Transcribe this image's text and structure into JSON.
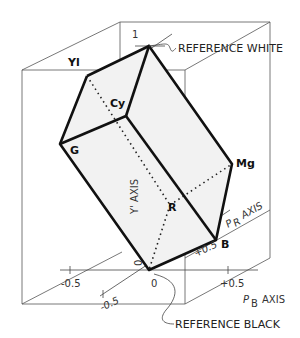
{
  "diagram": {
    "type": "color-space-solid",
    "vertices": {
      "yellow": "Yl",
      "cyan": "Cy",
      "green": "G",
      "magenta": "Mg",
      "red": "R",
      "blue": "B"
    },
    "annotations": {
      "reference_white": "REFERENCE WHITE",
      "reference_black": "REFERENCE BLACK"
    },
    "axes": {
      "y_axis": "Y' AXIS",
      "pb_axis": "AXIS",
      "pb_symbol": "P",
      "pb_sub": "B",
      "pr_axis": "AXIS",
      "pr_symbol": "P",
      "pr_sub": "R"
    },
    "ticks": {
      "y_top": "1",
      "y_zero": "0",
      "pb_neg": "-0.5",
      "pb_zero": "0",
      "pb_pos": "+0.5",
      "pr_neg": "-0.5",
      "pr_pos": "+0.5"
    }
  }
}
